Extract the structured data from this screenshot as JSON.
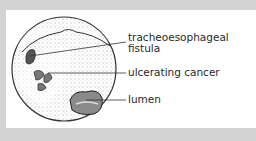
{
  "figure": {
    "labels": [
      {
        "id": "fistula",
        "line1": "tracheoesophageal",
        "line2": "fistula"
      },
      {
        "id": "cancer",
        "line1": "ulcerating cancer"
      },
      {
        "id": "lumen",
        "line1": "lumen"
      }
    ]
  },
  "colors": {
    "background": "#d3d3d3",
    "panel": "#ffffff",
    "ink": "#2a2a2a"
  }
}
